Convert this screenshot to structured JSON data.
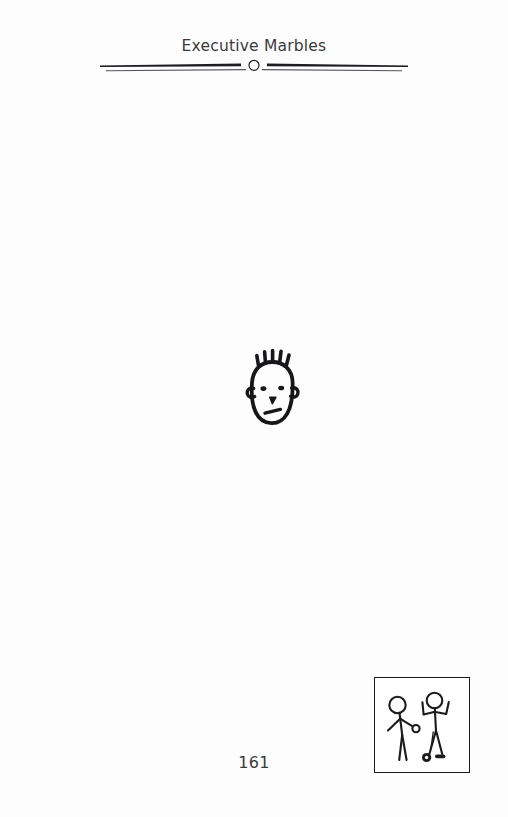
{
  "page": {
    "kind": "book-page",
    "background_color": "#fdfdfd",
    "ink_color": "#1b1b1b"
  },
  "running_head": {
    "title": "Executive Marbles"
  },
  "divider": {
    "ornament": "open-circle",
    "ornament_label": "circle-ornament",
    "line_color": "#1e1e22",
    "secondary_line_color": "#4a4a50"
  },
  "illustration": {
    "name": "cartoon-face",
    "description": "Cartoon face with spiky hair",
    "hair_spikes": 5,
    "eyes": 2,
    "ears": 2,
    "stroke_color": "#17171a"
  },
  "cartoon_box": {
    "name": "marbles-scene",
    "description": "Two stick figures playing marbles",
    "border_color": "#1b1b1b",
    "figures": [
      {
        "name": "rolling-figure",
        "pose": "arm-extended-rolling-marble"
      },
      {
        "name": "celebrating-figure",
        "pose": "both-arms-raised"
      }
    ],
    "marbles": [
      {
        "name": "held-marble",
        "style": "open-circle"
      },
      {
        "name": "ring-marble",
        "style": "dark-ring"
      },
      {
        "name": "streak-marble",
        "style": "dark-bar"
      }
    ]
  },
  "folio": {
    "page_number": "161"
  }
}
